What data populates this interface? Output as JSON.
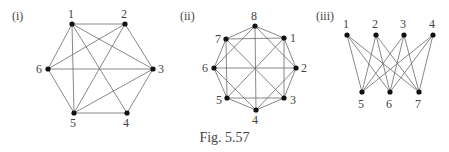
{
  "figure": {
    "caption": "Fig. 5.57",
    "graphs": [
      {
        "label": "(i)",
        "label_pos": [
          12,
          20
        ],
        "vertices": [
          {
            "id": "1",
            "x": 72,
            "y": 24,
            "lx": 68,
            "ly": 18
          },
          {
            "id": "2",
            "x": 125,
            "y": 24,
            "lx": 121,
            "ly": 18
          },
          {
            "id": "3",
            "x": 153,
            "y": 69,
            "lx": 158,
            "ly": 73
          },
          {
            "id": "4",
            "x": 127,
            "y": 113,
            "lx": 123,
            "ly": 127
          },
          {
            "id": "5",
            "x": 74,
            "y": 113,
            "lx": 70,
            "ly": 127
          },
          {
            "id": "6",
            "x": 48,
            "y": 69,
            "lx": 36,
            "ly": 73
          }
        ],
        "edges": [
          [
            "1",
            "2"
          ],
          [
            "2",
            "3"
          ],
          [
            "3",
            "4"
          ],
          [
            "4",
            "5"
          ],
          [
            "5",
            "6"
          ],
          [
            "6",
            "1"
          ],
          [
            "1",
            "3"
          ],
          [
            "1",
            "4"
          ],
          [
            "1",
            "5"
          ],
          [
            "2",
            "6"
          ],
          [
            "2",
            "5"
          ],
          [
            "3",
            "6"
          ],
          [
            "3",
            "5"
          ]
        ]
      },
      {
        "label": "(ii)",
        "label_pos": [
          180,
          20
        ],
        "vertices": [
          {
            "id": "8",
            "x": 255,
            "y": 26,
            "lx": 251,
            "ly": 20
          },
          {
            "id": "1",
            "x": 284,
            "y": 38,
            "lx": 290,
            "ly": 42
          },
          {
            "id": "2",
            "x": 296,
            "y": 68,
            "lx": 301,
            "ly": 72
          },
          {
            "id": "3",
            "x": 284,
            "y": 98,
            "lx": 290,
            "ly": 104
          },
          {
            "id": "4",
            "x": 256,
            "y": 110,
            "lx": 252,
            "ly": 124
          },
          {
            "id": "5",
            "x": 227,
            "y": 98,
            "lx": 216,
            "ly": 104
          },
          {
            "id": "6",
            "x": 214,
            "y": 68,
            "lx": 202,
            "ly": 72
          },
          {
            "id": "7",
            "x": 226,
            "y": 39,
            "lx": 215,
            "ly": 43
          }
        ],
        "edges": [
          [
            "8",
            "1"
          ],
          [
            "1",
            "2"
          ],
          [
            "2",
            "3"
          ],
          [
            "3",
            "4"
          ],
          [
            "4",
            "5"
          ],
          [
            "5",
            "6"
          ],
          [
            "6",
            "7"
          ],
          [
            "7",
            "8"
          ],
          [
            "7",
            "1"
          ],
          [
            "1",
            "3"
          ],
          [
            "3",
            "5"
          ],
          [
            "5",
            "7"
          ],
          [
            "8",
            "2"
          ],
          [
            "2",
            "4"
          ],
          [
            "4",
            "6"
          ],
          [
            "6",
            "8"
          ],
          [
            "8",
            "4"
          ],
          [
            "7",
            "3"
          ],
          [
            "6",
            "2"
          ],
          [
            "5",
            "1"
          ]
        ]
      },
      {
        "label": "(iii)",
        "label_pos": [
          316,
          20
        ],
        "vertices": [
          {
            "id": "1",
            "x": 347,
            "y": 35,
            "lx": 343,
            "ly": 28
          },
          {
            "id": "2",
            "x": 376,
            "y": 35,
            "lx": 372,
            "ly": 28
          },
          {
            "id": "3",
            "x": 404,
            "y": 35,
            "lx": 400,
            "ly": 28
          },
          {
            "id": "4",
            "x": 433,
            "y": 35,
            "lx": 429,
            "ly": 28
          },
          {
            "id": "5",
            "x": 362,
            "y": 92,
            "lx": 358,
            "ly": 108
          },
          {
            "id": "6",
            "x": 390,
            "y": 92,
            "lx": 386,
            "ly": 108
          },
          {
            "id": "7",
            "x": 419,
            "y": 92,
            "lx": 415,
            "ly": 108
          }
        ],
        "edges": [
          [
            "1",
            "5"
          ],
          [
            "1",
            "6"
          ],
          [
            "1",
            "7"
          ],
          [
            "2",
            "5"
          ],
          [
            "2",
            "6"
          ],
          [
            "2",
            "7"
          ],
          [
            "3",
            "5"
          ],
          [
            "3",
            "6"
          ],
          [
            "3",
            "7"
          ],
          [
            "4",
            "5"
          ],
          [
            "4",
            "6"
          ],
          [
            "4",
            "7"
          ]
        ]
      }
    ]
  }
}
